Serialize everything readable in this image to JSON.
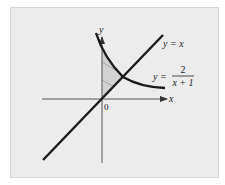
{
  "figure": {
    "axis_labels": {
      "x": "x",
      "y": "y",
      "origin": "0"
    },
    "curves": [
      {
        "name": "line",
        "label": "y = x"
      },
      {
        "name": "curve",
        "label_prefix": "y =",
        "numerator": "2",
        "denominator": "x + 1"
      }
    ],
    "shaded_region": "region bounded by y-axis, y = x and y = 2/(x+1)",
    "colors": {
      "panel_bg": "#ececec",
      "curve": "#1a1a1a",
      "axis": "#555555",
      "shade": "#d2d2d2",
      "hatch": "#9a9a9a"
    }
  }
}
